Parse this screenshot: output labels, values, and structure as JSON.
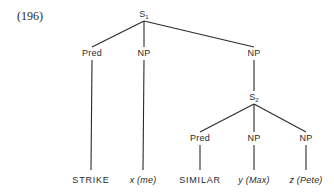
{
  "example_number": "(196)",
  "nodes": [
    {
      "id": "S1",
      "text": "S",
      "sub": "1",
      "kind": "root"
    },
    {
      "id": "pred1",
      "text": "Pred",
      "parent": "S1"
    },
    {
      "id": "np1",
      "text": "NP",
      "parent": "S1"
    },
    {
      "id": "np2",
      "text": "NP",
      "parent": "S1"
    },
    {
      "id": "S2",
      "text": "S",
      "sub": "2",
      "parent": "np2"
    },
    {
      "id": "pred2",
      "text": "Pred",
      "parent": "S2"
    },
    {
      "id": "np3",
      "text": "NP",
      "parent": "S2"
    },
    {
      "id": "np4",
      "text": "NP",
      "parent": "S2"
    },
    {
      "id": "leaf1",
      "text": "STRIKE",
      "parent": "pred1",
      "style": "caps"
    },
    {
      "id": "leaf2",
      "text": "x (me)",
      "parent": "np1",
      "style": "italic"
    },
    {
      "id": "leaf3",
      "text": "SIMILAR",
      "parent": "pred2",
      "style": "caps"
    },
    {
      "id": "leaf4",
      "text": "y (Max)",
      "parent": "np3",
      "style": "italic"
    },
    {
      "id": "leaf5",
      "text": "z (Pete)",
      "parent": "np4",
      "style": "italic"
    }
  ]
}
